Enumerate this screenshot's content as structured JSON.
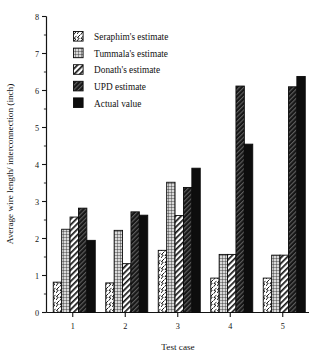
{
  "chart_data": {
    "type": "bar",
    "title": "",
    "subtitle": "",
    "xlabel": "Test case",
    "ylabel": "Average wire length/ interconnection (inch)",
    "categories": [
      "1",
      "2",
      "3",
      "4",
      "5"
    ],
    "ylim": [
      0,
      8
    ],
    "ytick_labels": [
      "0",
      "1",
      "2",
      "3",
      "4",
      "5",
      "6",
      "7",
      "8"
    ],
    "ytick_values": [
      0,
      1,
      2,
      3,
      4,
      5,
      6,
      7,
      8
    ],
    "yminor_step": 0.5,
    "grid": false,
    "legend_position": "upper-left-inside",
    "series": [
      {
        "name": "Seraphim's estimate",
        "pattern": "wavy-zigzag-hatch",
        "values": [
          0.82,
          0.8,
          1.68,
          0.93,
          0.93
        ]
      },
      {
        "name": "Tummala's estimate",
        "pattern": "fine-grid",
        "values": [
          2.25,
          2.22,
          3.52,
          1.57,
          1.55
        ]
      },
      {
        "name": "Donath's estimate",
        "pattern": "diagonal-stripes",
        "values": [
          2.58,
          1.32,
          2.62,
          1.57,
          1.55
        ]
      },
      {
        "name": "UPD estimate",
        "pattern": "dark-diagonal-hatch",
        "values": [
          2.82,
          2.72,
          3.38,
          6.12,
          6.1
        ]
      },
      {
        "name": "Actual value",
        "pattern": "solid-black",
        "values": [
          1.95,
          2.63,
          3.9,
          4.55,
          6.38
        ]
      }
    ]
  },
  "colors": {
    "ink": "#111111",
    "axis": "#141414",
    "background": "#ffffff",
    "solid_fill": "#0d0d0d",
    "dark_hatch_fill": "#1a1a1a",
    "light_fill": "#ffffff",
    "mid_fill": "#9a9a9a"
  }
}
